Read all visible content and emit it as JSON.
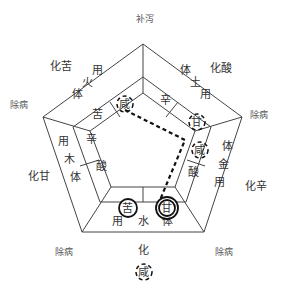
{
  "vertex_labels": {
    "top": "补泻",
    "upper_left": "除病",
    "upper_right": "除病",
    "lower_left": "除病",
    "lower_right": "除病"
  },
  "outer_labels": {
    "upper_left_side": "化苦",
    "upper_right_side": "化酸",
    "left_side": "化甘",
    "right_side": "化辛",
    "bottom_side": "化",
    "bottom_highlight": "咸"
  },
  "sections": {
    "wood": {
      "outer": [
        "用",
        "木",
        "体"
      ],
      "inner": [
        "辛",
        "酸"
      ]
    },
    "fire": {
      "outer": [
        "用",
        "火",
        "体"
      ],
      "inner": [
        "咸",
        "苦"
      ]
    },
    "earth": {
      "outer": [
        "体",
        "土",
        "用"
      ],
      "inner": [
        "辛",
        "甘"
      ]
    },
    "metal": {
      "outer": [
        "体",
        "金",
        "用"
      ],
      "inner": [
        "咸",
        "酸"
      ]
    },
    "water": {
      "outer": [
        "用",
        "水",
        "体"
      ],
      "inner": [
        "苦",
        "甘"
      ]
    }
  },
  "highlights": {
    "dashed_circles": [
      "咸",
      "甘",
      "咸",
      "咸"
    ],
    "solid_circles": [
      "苦",
      "甘"
    ]
  },
  "colors": {
    "line": "#444444",
    "text": "#333333",
    "background": "#ffffff"
  }
}
